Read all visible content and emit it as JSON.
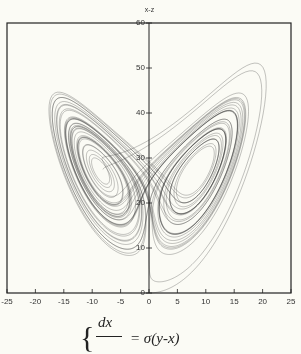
{
  "chart_data": {
    "type": "line",
    "title": "x-z",
    "xlabel": "",
    "ylabel": "",
    "xlim": [
      -25,
      25
    ],
    "ylim": [
      0,
      60
    ],
    "x_ticks": [
      "-25",
      "-20",
      "-15",
      "-10",
      "-5",
      "0",
      "5",
      "10",
      "15",
      "20",
      "25"
    ],
    "y_ticks": [
      "0",
      "10",
      "20",
      "30",
      "40",
      "50",
      "60"
    ],
    "series": [
      {
        "name": "Lorenz attractor x-z projection",
        "description": "trajectory of Lorenz system sigma=10, rho=28, beta=8/3, two lobes centered near x=-8.5,z=27 and x=8.5,z=27"
      }
    ],
    "grid": false
  },
  "equation": {
    "numerator": "dx",
    "rhs": "= σ(y-x)"
  },
  "colors": {
    "line": "#333333",
    "background": "#fbfbf5"
  }
}
